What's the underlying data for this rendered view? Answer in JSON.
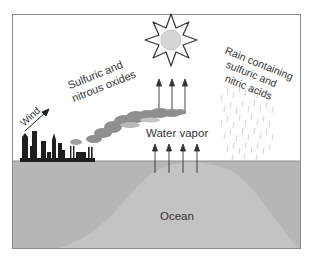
{
  "diagram": {
    "labels": {
      "wind": "Wind",
      "oxides_line1": "Sulfuric and",
      "oxides_line2": "nitrous oxides",
      "rain_line1": "Rain containing",
      "rain_line2": "sulfuric and",
      "rain_line3": "nitric acids",
      "water_vapor": "Water vapor",
      "ocean": "Ocean"
    },
    "icons": {
      "sun": "sun-icon",
      "wind_arrow": "arrow-up-right-icon",
      "city": "city-skyline-icon",
      "smoke": "smoke-plume-icon",
      "rain": "rain-icon",
      "vapor_arrows": "arrow-up-icon"
    },
    "colors": {
      "frame": "#8a8a8a",
      "sky": "#ffffff",
      "ocean": "#b4b4b4",
      "ocean_light": "#c2c2c2",
      "city": "#1e1e1e",
      "smoke": "#8f8f8f",
      "sun_center": "#d6d6d6",
      "text": "#333333"
    }
  }
}
